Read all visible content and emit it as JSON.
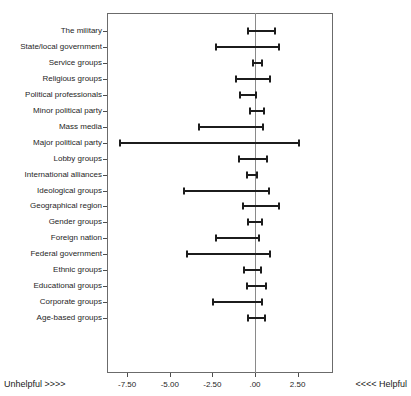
{
  "chart_data": {
    "type": "bar",
    "subtype": "horizontal-error-bar-ci",
    "title": "",
    "xlabel": "",
    "ylabel": "",
    "xlim": [
      -9.21,
      -9.21
    ],
    "axis_range": [
      -8.68,
      4.58
    ],
    "grid": false,
    "legend": null,
    "xticks": [
      -7.5,
      -5.0,
      -2.5,
      0.0,
      2.5
    ],
    "xtick_labels": [
      "-7.50",
      "-5.00",
      "-2.50",
      ".00",
      "2.50"
    ],
    "reference_line": 0.0,
    "left_axis_note": "Unhelpful >>>>",
    "right_axis_note": "<<<< Helpful",
    "categories": [
      "The military",
      "State/local government",
      "Service groups",
      "Religious groups",
      "Political professionals",
      "Minor political party",
      "Mass media",
      "Major political party",
      "Lobby groups",
      "International alliances",
      "Ideological groups",
      "Geographical region",
      "Gender groups",
      "Foreign nation",
      "Federal government",
      "Ethnic groups",
      "Educational groups",
      "Corporate groups",
      "Age-based groups"
    ],
    "intervals": [
      {
        "category": "The military",
        "low": -0.49,
        "high": 1.23
      },
      {
        "category": "State/local government",
        "low": -2.35,
        "high": 1.47
      },
      {
        "category": "Service groups",
        "low": -0.19,
        "high": 0.45
      },
      {
        "category": "Religious groups",
        "low": -1.17,
        "high": 0.92
      },
      {
        "category": "Political professionals",
        "low": -0.92,
        "high": 0.13
      },
      {
        "category": "Minor political party",
        "low": -0.33,
        "high": 0.59
      },
      {
        "category": "Mass media",
        "low": -3.36,
        "high": 0.55
      },
      {
        "category": "Major political party",
        "low": -7.95,
        "high": 2.64
      },
      {
        "category": "Lobby groups",
        "low": -0.98,
        "high": 0.78
      },
      {
        "category": "International alliances",
        "low": -0.53,
        "high": 0.19
      },
      {
        "category": "Ideological groups",
        "low": -4.24,
        "high": 0.88
      },
      {
        "category": "Geographical region",
        "low": -0.78,
        "high": 1.47
      },
      {
        "category": "Gender groups",
        "low": -0.45,
        "high": 0.49
      },
      {
        "category": "Foreign nation",
        "low": -2.35,
        "high": 0.29
      },
      {
        "category": "Federal government",
        "low": -4.05,
        "high": 0.92
      },
      {
        "category": "Ethnic groups",
        "low": -0.72,
        "high": 0.39
      },
      {
        "category": "Educational groups",
        "low": -0.53,
        "high": 0.72
      },
      {
        "category": "Corporate groups",
        "low": -2.54,
        "high": 0.49
      },
      {
        "category": "Age-based groups",
        "low": -0.45,
        "high": 0.65
      }
    ]
  }
}
